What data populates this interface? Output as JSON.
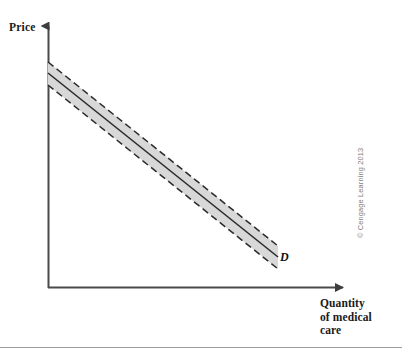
{
  "figure": {
    "background_color": "#ffffff",
    "width": 402,
    "height": 356,
    "bottom_rule_color": "#9a9a9a"
  },
  "labels": {
    "y_axis": "Price",
    "x_axis_line1": "Quantity",
    "x_axis_line2": "of medical",
    "x_axis_line3": "care",
    "curve": "D",
    "copyright": "© Cengage Learning 2013"
  },
  "chart_data": {
    "type": "line",
    "title": "",
    "subtitle": "",
    "xlabel": "Quantity of medical care",
    "ylabel": "Price",
    "grid": false,
    "legend": "none",
    "annotations": [
      {
        "text": "D",
        "x": 0.8,
        "y": 0.12,
        "style": "bold-italic",
        "meaning": "demand curve label"
      }
    ],
    "axes": {
      "x_range_px": [
        48,
        348
      ],
      "y_range_px": [
        288,
        22
      ],
      "ticks": [],
      "tick_labels": [],
      "arrowheads": [
        "x-right",
        "y-top"
      ],
      "axis_color": "#4a4a4a"
    },
    "series": [
      {
        "name": "Demand (D)",
        "style": "solid",
        "color": "#2b2b2b",
        "x": [
          48,
          278
        ],
        "y_px": [
          73,
          257
        ],
        "description": "downward-sloping linear demand curve for medical care"
      },
      {
        "name": "Upper uncertainty bound",
        "style": "dashed",
        "color": "#2b2b2b",
        "x": [
          48,
          278
        ],
        "y_px": [
          62,
          246
        ]
      },
      {
        "name": "Lower uncertainty bound",
        "style": "dashed",
        "color": "#2b2b2b",
        "x": [
          48,
          278
        ],
        "y_px": [
          85,
          269
        ]
      }
    ],
    "band": {
      "name": "Demand range band",
      "fill_color": "#d8d8d8",
      "edge_style": "dashed",
      "edge_color": "#2b2b2b",
      "start_x_px": 48,
      "end_x_px": 278,
      "start_y_top_px": 62,
      "start_y_bottom_px": 85,
      "end_y_top_px": 246,
      "end_y_bottom_px": 269
    }
  }
}
